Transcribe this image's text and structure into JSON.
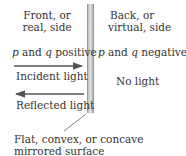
{
  "diagram": {
    "front_label": [
      "Front, or",
      "real, side"
    ],
    "back_label": [
      "Back, or",
      "virtual, side"
    ],
    "front_sign": {
      "p": "p",
      "and": "and",
      "q": "q",
      "rest": "positive"
    },
    "back_sign": {
      "p": "p",
      "and": "and",
      "q": "q",
      "rest": "negative"
    },
    "incident": "Incident light",
    "reflected": "Reflected light",
    "no_light": "No light",
    "surface_label": [
      "Flat, convex, or concave",
      "mirrored surface"
    ]
  }
}
